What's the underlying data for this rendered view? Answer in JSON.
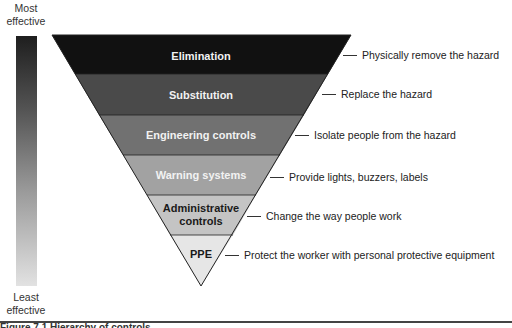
{
  "scale": {
    "top_label": "Most effective",
    "top_label_lines": [
      "Most",
      "effective"
    ],
    "bottom_label_lines": [
      "Least",
      "effective"
    ],
    "bottom_label": "Least effective"
  },
  "hierarchy": [
    {
      "label": "Elimination",
      "description": "Physically remove the hazard",
      "fill": "#111111",
      "text_color": "light"
    },
    {
      "label": "Substitution",
      "description": "Replace the hazard",
      "fill": "#4a4a4a",
      "text_color": "light"
    },
    {
      "label": "Engineering controls",
      "description": "Isolate people from the hazard",
      "fill": "#717171",
      "text_color": "light"
    },
    {
      "label": "Warning systems",
      "description": "Provide lights, buzzers, labels",
      "fill": "#a2a2a2",
      "text_color": "light"
    },
    {
      "label": "Administrative controls",
      "label_lines": [
        "Administrative",
        "controls"
      ],
      "description": "Change the way people work",
      "fill": "#c4c4c4",
      "text_color": "dark"
    },
    {
      "label": "PPE",
      "description": "Protect the worker with personal protective equipment",
      "fill": "#e6e6e6",
      "text_color": "dark"
    }
  ],
  "caption": "Figure 7.1 Hierarchy of controls"
}
